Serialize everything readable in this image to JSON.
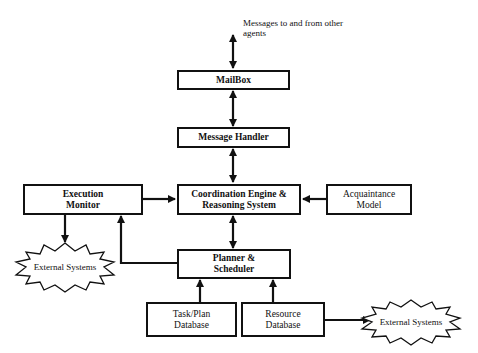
{
  "diagram": {
    "top_note": "Messages to and from other agents",
    "nodes": {
      "mailbox": "MailBox",
      "message_handler": "Message Handler",
      "coordination": "Coordination Engine & Reasoning System",
      "execution_monitor": "Execution Monitor",
      "acquaintance": "Acquaintance Model",
      "planner": "Planner & Scheduler",
      "taskplan_db": "Task/Plan Database",
      "resource_db": "Resource Database",
      "external_left": "External Systems",
      "external_right": "External Systems"
    },
    "edges": [
      {
        "from": "other agents",
        "to": "mailbox",
        "type": "bidirectional"
      },
      {
        "from": "mailbox",
        "to": "message_handler",
        "type": "bidirectional"
      },
      {
        "from": "message_handler",
        "to": "coordination",
        "type": "bidirectional"
      },
      {
        "from": "execution_monitor",
        "to": "coordination",
        "type": "directed"
      },
      {
        "from": "acquaintance",
        "to": "coordination",
        "type": "directed"
      },
      {
        "from": "coordination",
        "to": "planner",
        "type": "bidirectional"
      },
      {
        "from": "planner",
        "to": "execution_monitor",
        "type": "directed"
      },
      {
        "from": "execution_monitor",
        "to": "external_left",
        "type": "directed"
      },
      {
        "from": "taskplan_db",
        "to": "planner",
        "type": "directed"
      },
      {
        "from": "resource_db",
        "to": "planner",
        "type": "directed"
      },
      {
        "from": "resource_db",
        "to": "external_right",
        "type": "directed"
      }
    ]
  }
}
